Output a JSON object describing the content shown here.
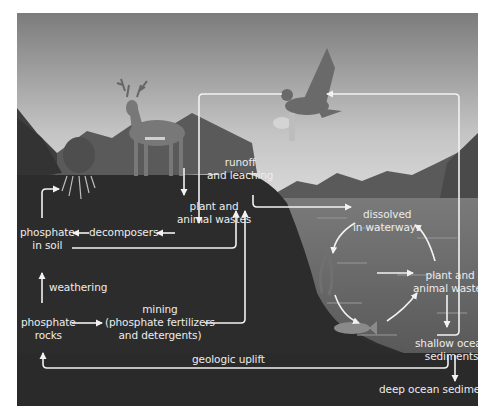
{
  "diagram": {
    "colors": {
      "sky_top": "#7e7e7e",
      "sky_bottom": "#d8d8d8",
      "soil": "#2c2c2c",
      "water": "#6a6a6a",
      "mountains": "#5e5e5e",
      "arrow": "#f2f2f2",
      "text": "#ececec"
    },
    "illustrations": [
      "deer",
      "eagle",
      "grass-roots",
      "fish",
      "seaweed",
      "mountains"
    ],
    "labels": {
      "runoff": [
        "runoff",
        "and leaching"
      ],
      "plant_wastes_land": [
        "plant and",
        "animal wastes"
      ],
      "decomposers": "decomposers",
      "phosphate_soil": [
        "phosphate",
        "in soil"
      ],
      "weathering": "weathering",
      "phosphate_rocks": [
        "phosphate",
        "rocks"
      ],
      "mining": [
        "mining",
        "(phosphate fertilizers",
        "and detergents)"
      ],
      "dissolved": [
        "dissolved",
        "in waterways"
      ],
      "plant_wastes_water": [
        "plant and",
        "animal wastes"
      ],
      "shallow_sediments": [
        "shallow ocean",
        "sediments"
      ],
      "geologic_uplift": "geologic uplift",
      "deep_sediments": "deep ocean sediments"
    }
  }
}
